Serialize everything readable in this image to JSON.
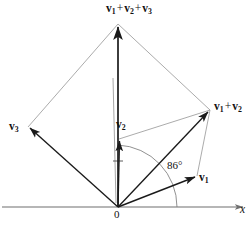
{
  "figure": {
    "background_color": "#ffffff",
    "width": 252,
    "height": 225
  },
  "labels": {
    "sum_all": {
      "vector": "v",
      "sub1": "1",
      "sub2": "2",
      "sub3": "3",
      "operator": "+",
      "text": "v1 + v2 + v3"
    },
    "sum_12": {
      "vector": "v",
      "sub1": "1",
      "sub2": "2",
      "operator": "+",
      "text": "v1 + v2"
    },
    "v1": {
      "vector": "v",
      "sub": "1",
      "text": "v1"
    },
    "v2": {
      "vector": "v",
      "sub": "2",
      "text": "v2"
    },
    "v3": {
      "vector": "v",
      "sub": "3",
      "text": "v3"
    },
    "angle": "86°",
    "origin": "0",
    "axis_x": "x"
  },
  "colors": {
    "vector_stroke": "#1a1a1a",
    "construction_stroke": "#8a8a8a",
    "axis_stroke": "#6f6f6f",
    "arc_stroke": "#7d7d7d",
    "text": "#111111"
  },
  "geometry": {
    "origin": {
      "x": 118,
      "y": 207
    },
    "axis": {
      "x_start": 2,
      "x_end": 245,
      "y": 207
    },
    "points": {
      "tip_v1": {
        "x": 197,
        "y": 176
      },
      "tip_v2": {
        "x": 119,
        "y": 139
      },
      "tip_v3": {
        "x": 28,
        "y": 127
      },
      "tip_sum12": {
        "x": 210,
        "y": 110
      },
      "tip_sum123": {
        "x": 118,
        "y": 24
      }
    },
    "angle_arc": {
      "value_degrees": 86,
      "radius": 62
    }
  }
}
